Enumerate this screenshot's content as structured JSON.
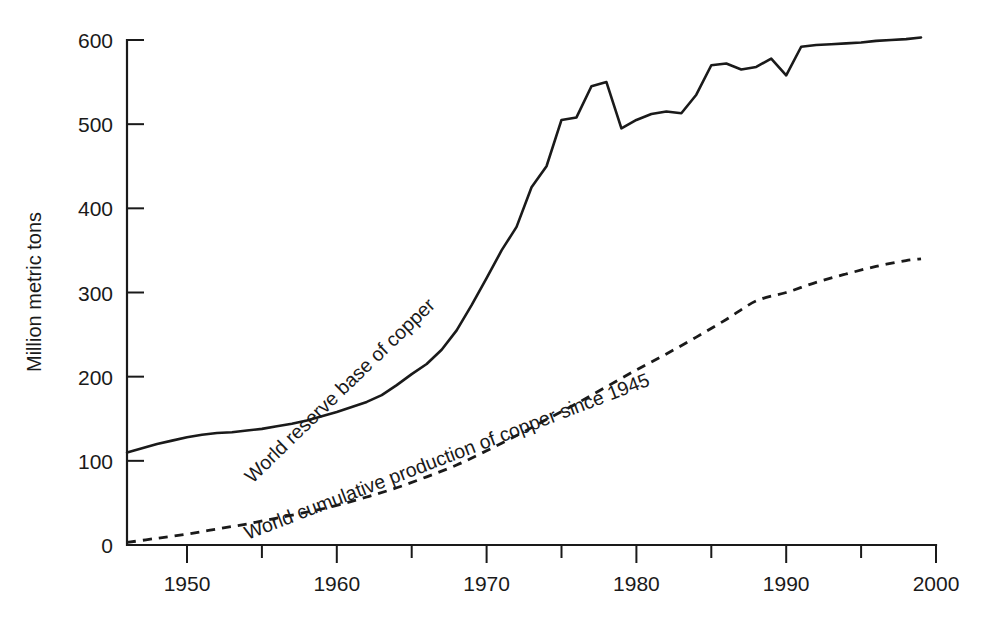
{
  "chart_data": {
    "type": "line",
    "title": "",
    "xlabel": "",
    "ylabel": "Million metric tons",
    "xlim": [
      1946,
      2000
    ],
    "ylim": [
      0,
      600
    ],
    "grid": false,
    "legend_position": "inline-curve-labels",
    "x_ticks_major": [
      1950,
      1960,
      1970,
      1980,
      1990,
      2000
    ],
    "x_ticks_minor": [
      1955,
      1965,
      1975,
      1985,
      1995
    ],
    "x_tick_labels": [
      "1950",
      "1960",
      "1970",
      "1980",
      "1990",
      "2000"
    ],
    "y_ticks": [
      0,
      100,
      200,
      300,
      400,
      500,
      600
    ],
    "y_tick_labels": [
      "0",
      "100",
      "200",
      "300",
      "400",
      "500",
      "600"
    ],
    "series": [
      {
        "name": "World reserve base of copper",
        "style": "solid",
        "color": "#1a1a1a",
        "label_rotation": -44,
        "label_anchor_x": 1960.5,
        "label_anchor_y": 178,
        "x": [
          1946,
          1947,
          1948,
          1949,
          1950,
          1951,
          1952,
          1953,
          1954,
          1955,
          1956,
          1957,
          1958,
          1959,
          1960,
          1961,
          1962,
          1963,
          1964,
          1965,
          1966,
          1967,
          1968,
          1969,
          1970,
          1971,
          1972,
          1973,
          1974,
          1975,
          1976,
          1977,
          1978,
          1979,
          1980,
          1981,
          1982,
          1983,
          1984,
          1985,
          1986,
          1987,
          1988,
          1989,
          1990,
          1991,
          1992,
          1993,
          1994,
          1995,
          1996,
          1997,
          1998,
          1999
        ],
        "values": [
          110,
          115,
          120,
          124,
          128,
          131,
          133,
          134,
          136,
          138,
          141,
          144,
          148,
          153,
          158,
          164,
          170,
          178,
          190,
          203,
          215,
          232,
          255,
          285,
          317,
          350,
          378,
          425,
          450,
          505,
          508,
          545,
          550,
          495,
          505,
          512,
          515,
          513,
          535,
          570,
          572,
          565,
          568,
          578,
          558,
          592,
          594,
          595,
          596,
          597,
          599,
          600,
          601,
          603
        ]
      },
      {
        "name": "World cumulative production of copper since 1945",
        "style": "dashed",
        "color": "#1a1a1a",
        "label_rotation": -21,
        "label_anchor_x": 1967.5,
        "label_anchor_y": 98,
        "x": [
          1946,
          1948,
          1950,
          1952,
          1954,
          1956,
          1958,
          1960,
          1962,
          1964,
          1966,
          1968,
          1970,
          1972,
          1974,
          1976,
          1978,
          1980,
          1982,
          1984,
          1986,
          1988,
          1990,
          1992,
          1994,
          1996,
          1998,
          1999
        ],
        "values": [
          3,
          8,
          13,
          19,
          25,
          32,
          39,
          47,
          57,
          68,
          81,
          95,
          112,
          130,
          149,
          168,
          188,
          208,
          227,
          247,
          268,
          290,
          300,
          312,
          322,
          331,
          338,
          340
        ]
      }
    ]
  },
  "axis": {
    "y_title": "Million metric tons"
  }
}
